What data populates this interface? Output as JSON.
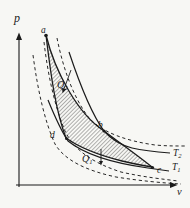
{
  "figure": {
    "type": "pv-diagram-thermodynamic-cycle",
    "colors": {
      "background": "#f7f7f4",
      "ink": "#1b1b1b"
    },
    "labels": {
      "p_axis": "p",
      "v_axis": "v",
      "point_a": "a",
      "point_b": "b",
      "point_c": "c",
      "point_d": "d",
      "heat_in_main": "Q",
      "heat_in_sub": "2",
      "heat_out_main": "Q",
      "heat_out_sub": "1",
      "isotherm_hot_main": "T",
      "isotherm_hot_sub": "2",
      "isotherm_cold_main": "T",
      "isotherm_cold_sub": "1"
    },
    "paths": {
      "y_axis": "M 19,187 L 19,39",
      "x_axis": "M 16,185 L 171,185",
      "dash_left_outer": "M 33,55 C 38,92 45,122 55,144 C 65,161 88,171 116,177 C 141,181 164,183 181,184",
      "dash_left_inner": "M 44,42 C 48,76 55,107 65,131 C 75,152 96,164 121,172 C 143,177 162,179 178,181",
      "dash_right": "M 57,38 C 63,68 73,97 89,118 C 103,133 127,141 155,145 C 166,146 175,146 186,146",
      "isotherm_t2": "M 69,52 C 81,88 93,116 104,131 C 112,140 120,145 132,148 C 145,151 157,152 170,153",
      "isotherm_t1": "M 48,100 C 57,122 62,132 68,141 C 84,154 112,163 148,168 C 155,169 162,170 169,171",
      "cycle_a_d": "M 46,35 C 51,77 56,112 66,138",
      "cycle_d_c": "M 66,138 C 80,148 102,156 122,161 C 135,164 145,166 152,167",
      "cycle_a_b_c": "M 46,35 C 55,72 78,114 104,131 C 120,143 137,155 152,167",
      "cycle_fill": "M 46,35 C 55,72 78,114 104,131 C 120,143 137,155 152,167 C 145,166 135,164 122,161 C 102,156 80,148 66,138 C 56,112 51,77 46,35 Z",
      "heat_in_arrow": "M 71,70 L 64,89",
      "heat_out_arrow": "M 101,149 L 101,161"
    },
    "dots": {
      "a": {
        "x": 46,
        "y": 35.5,
        "r": 1.8
      },
      "b": {
        "x": 104,
        "y": 131,
        "r": 1.5
      },
      "c": {
        "x": 152.5,
        "y": 167.5,
        "r": 1.6
      },
      "d": {
        "x": 66.5,
        "y": 138.5,
        "r": 1.5
      }
    }
  }
}
